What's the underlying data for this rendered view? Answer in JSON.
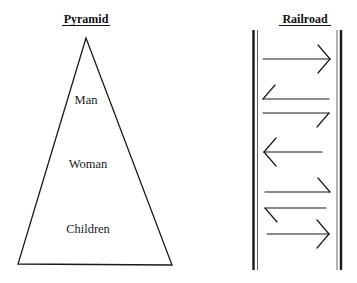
{
  "pyramid": {
    "title": "Pyramid",
    "levels": [
      "Man",
      "Woman",
      "Children"
    ]
  },
  "railroad": {
    "title": "Railroad",
    "arrows": [
      {
        "direction": "right",
        "barbs": "both"
      },
      {
        "direction": "left",
        "barbs": "upper"
      },
      {
        "direction": "right",
        "barbs": "lower"
      },
      {
        "direction": "left",
        "barbs": "both"
      },
      {
        "direction": "right",
        "barbs": "upper"
      },
      {
        "direction": "left",
        "barbs": "lower"
      },
      {
        "direction": "right",
        "barbs": "both"
      }
    ]
  },
  "colors": {
    "stroke": "#1a1a1a",
    "background": "#ffffff"
  }
}
